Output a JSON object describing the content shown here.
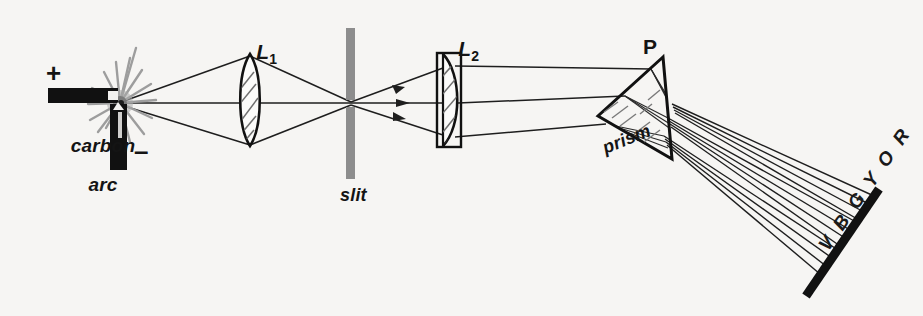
{
  "figure": {
    "background_color": "#f6f5f3",
    "ink_color": "#141414",
    "slit_color": "#8a8a8a",
    "arc_glow_color": "#9a9a9a"
  },
  "labels": {
    "source_line1": "carbon",
    "source_line2": "arc",
    "positive_terminal": "+",
    "negative_terminal": "–",
    "lens1": "L",
    "lens1_subscript": "1",
    "lens2": "L",
    "lens2_subscript": "2",
    "slit": "slit",
    "prism_letter": "P",
    "prism": "prism",
    "spectrum": "V B G Y O R"
  },
  "components": [
    {
      "name": "carbon-arc-source",
      "label": "carbon arc",
      "x": 120,
      "y": 103
    },
    {
      "name": "lens-l1",
      "label": "L1",
      "type": "biconvex",
      "x": 250,
      "y": 100
    },
    {
      "name": "slit",
      "label": "slit",
      "type": "aperture",
      "x": 350,
      "y": 103
    },
    {
      "name": "lens-l2",
      "label": "L2",
      "type": "plano-convex",
      "x": 452,
      "y": 100
    },
    {
      "name": "prism",
      "label": "P",
      "type": "triangular-prism",
      "x": 640,
      "y": 108
    },
    {
      "name": "screen",
      "label": "V B G Y O R",
      "type": "screen",
      "x": 842,
      "y": 242
    }
  ],
  "spectrum_letters": [
    "V",
    "B",
    "G",
    "Y",
    "O",
    "R"
  ],
  "spectrum_meaning": [
    "Violet",
    "Blue",
    "Green",
    "Yellow",
    "Orange",
    "Red"
  ]
}
